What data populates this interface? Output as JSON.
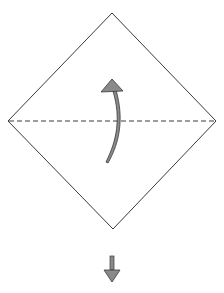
{
  "diagram": {
    "type": "origami-fold-step",
    "paper": {
      "shape": "square-rotated-45",
      "fill": "#ffffff",
      "stroke": "#3a3a3a"
    },
    "fold_line": {
      "style": "dashed",
      "orientation": "horizontal",
      "label": "valley-fold"
    },
    "fold_arrow": {
      "direction": "up",
      "fill": "#8a8a8a",
      "stroke": "#3a3a3a"
    },
    "next_step_arrow": {
      "direction": "down",
      "fill": "#8a8a8a",
      "stroke": "#3a3a3a"
    }
  }
}
